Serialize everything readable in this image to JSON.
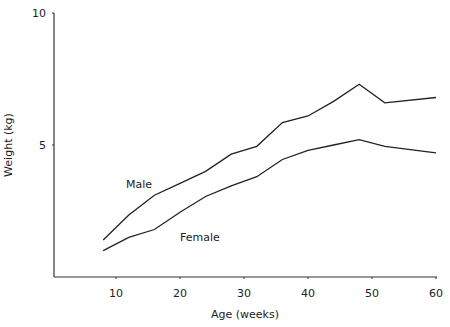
{
  "chart_data": {
    "type": "line",
    "title": "",
    "xlabel": "Age (weeks)",
    "ylabel": "Weight (kg)",
    "xlim": [
      0,
      60
    ],
    "ylim": [
      0,
      10
    ],
    "x_ticks": [
      10,
      20,
      30,
      40,
      50,
      60
    ],
    "y_ticks": [
      5,
      10
    ],
    "grid": false,
    "legend": "inline labels",
    "x": [
      8,
      12,
      16,
      20,
      24,
      28,
      32,
      36,
      40,
      44,
      48,
      52,
      60
    ],
    "series": [
      {
        "name": "Male",
        "values": [
          1.4,
          2.35,
          3.1,
          3.55,
          4.0,
          4.65,
          4.95,
          5.85,
          6.1,
          6.65,
          7.3,
          6.6,
          6.8
        ],
        "color": "#222222",
        "label_pos": [
          126,
          188
        ]
      },
      {
        "name": "Female",
        "values": [
          1.0,
          1.5,
          1.8,
          2.45,
          3.05,
          3.45,
          3.8,
          4.45,
          4.8,
          5.0,
          5.2,
          4.95,
          4.7
        ],
        "color": "#222222",
        "label_pos": [
          180,
          241
        ]
      }
    ]
  },
  "labels": {
    "xlabel": "Age (weeks)",
    "ylabel": "Weight (kg)",
    "male": "Male",
    "female": "Female",
    "xt10": "10",
    "xt20": "20",
    "xt30": "30",
    "xt40": "40",
    "xt50": "50",
    "xt60": "60",
    "yt5": "5",
    "yt10": "10"
  }
}
